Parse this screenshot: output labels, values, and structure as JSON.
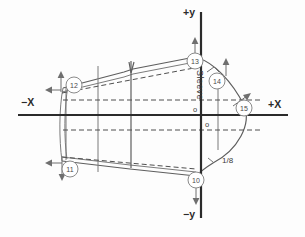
{
  "diagram": {
    "background_color": "#fdfdfd",
    "axis_color": "#2b2b2b",
    "pattern_color": "#7b7b7b",
    "dashed_color": "#4f4f4f",
    "marker_color": "#8a8a8a"
  },
  "axes": {
    "x_negative_label": "−X",
    "x_positive_label": "+X",
    "y_positive_label": "+y",
    "y_negative_label": "−y",
    "origin_upper_label": "o",
    "origin_lower_label": "o"
  },
  "annotations": {
    "sleeve_label": "Sleeve",
    "fraction_label": "1/8"
  },
  "markers": [
    {
      "id": "10",
      "label": "10",
      "cx": 196,
      "cy": 180,
      "arrow": "down"
    },
    {
      "id": "11",
      "label": "11",
      "cx": 70,
      "cy": 169,
      "arrow": "left-down"
    },
    {
      "id": "12",
      "label": "12",
      "cx": 74,
      "cy": 85,
      "arrow": "up-left"
    },
    {
      "id": "13",
      "label": "13",
      "cx": 195,
      "cy": 61,
      "arrow": "up"
    },
    {
      "id": "14",
      "label": "14",
      "cx": 217,
      "cy": 81,
      "arrow": "up"
    },
    {
      "id": "15",
      "label": "15",
      "cx": 244,
      "cy": 108,
      "arrow": "up-right"
    }
  ]
}
